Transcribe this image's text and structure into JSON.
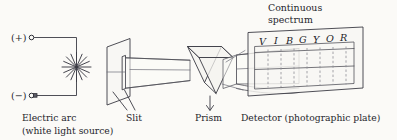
{
  "figure": {
    "title_heading": {
      "line1": "Continuous",
      "line2": "spectrum"
    },
    "terminals": {
      "positive": "(+)",
      "negative": "(−)"
    },
    "labels": {
      "source_line1": "Electric arc",
      "source_line2": "(white light source)",
      "slit": "Slit",
      "prism": "Prism",
      "detector": "Detector (photographic plate)"
    },
    "spectrum_letters": [
      {
        "letter": "V",
        "name": "violet"
      },
      {
        "letter": "I",
        "name": "indigo"
      },
      {
        "letter": "B",
        "name": "blue"
      },
      {
        "letter": "G",
        "name": "green"
      },
      {
        "letter": "Y",
        "name": "yellow"
      },
      {
        "letter": "O",
        "name": "orange"
      },
      {
        "letter": "R",
        "name": "red"
      }
    ],
    "colors": {
      "background": "#fbfaf7",
      "ink": "#25252c",
      "line": "#3b3b44",
      "faint_line": "#8d8d96"
    }
  }
}
